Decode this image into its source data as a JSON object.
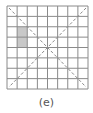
{
  "figure": {
    "caption": "(e)",
    "grid": {
      "rows": 8,
      "cols": 8,
      "line_color": "#8a8a8a",
      "background": "#ffffff"
    },
    "shaded_region": {
      "col": 1,
      "row_start": 2,
      "row_end": 3,
      "color": "#c8c8c8"
    },
    "diagonals": {
      "style": "dashed",
      "color": "#8a8a8a",
      "count": 2
    }
  }
}
